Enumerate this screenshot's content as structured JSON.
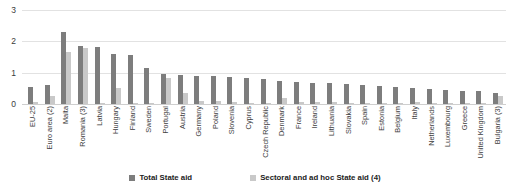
{
  "chart_data": {
    "type": "bar",
    "title": "",
    "xlabel": "",
    "ylabel": "",
    "ylim": [
      0,
      3
    ],
    "yticks": [
      0,
      1,
      2,
      3
    ],
    "grid": true,
    "legend_position": "bottom",
    "categories": [
      "EU-25",
      "Euro area (2)",
      "Malta",
      "Romania (3)",
      "Latvia",
      "Hungary",
      "Finland",
      "Sweden",
      "Portugal",
      "Austria",
      "Germany",
      "Poland",
      "Slovenia",
      "Cyprus",
      "Czech Republic",
      "Denmark",
      "France",
      "Ireland",
      "Lithuania",
      "Slovakia",
      "Spain",
      "Estonia",
      "Belgium",
      "Italy",
      "Netherlands",
      "Luxembourg",
      "Greece",
      "United Kingdom",
      "Bulgaria (3)"
    ],
    "series": [
      {
        "name": "Total State aid",
        "color": "#7d7d7d",
        "values": [
          0.55,
          0.62,
          2.3,
          1.86,
          1.83,
          1.6,
          1.57,
          1.15,
          0.95,
          0.93,
          0.9,
          0.88,
          0.85,
          0.82,
          0.8,
          0.72,
          0.7,
          0.68,
          0.66,
          0.64,
          0.6,
          0.58,
          0.55,
          0.52,
          0.48,
          0.45,
          0.42,
          0.4,
          0.35
        ]
      },
      {
        "name": "Sectoral and ad hoc State aid (4)",
        "color": "#c9c9c9",
        "values": [
          0.05,
          0.27,
          1.65,
          1.78,
          0.03,
          0.5,
          0.03,
          0.03,
          0.82,
          0.35,
          0.1,
          0.1,
          0.05,
          0.03,
          0.03,
          0.18,
          0.05,
          0.05,
          0.05,
          0.03,
          0.03,
          0.03,
          0.03,
          0.08,
          0.03,
          0.03,
          0.03,
          0.03,
          0.25
        ]
      }
    ],
    "legend": [
      "Total State aid",
      "Sectoral and ad hoc State aid (4)"
    ]
  }
}
